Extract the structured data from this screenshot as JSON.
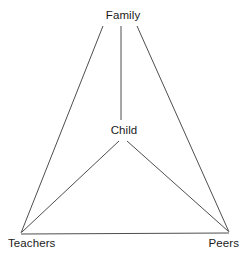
{
  "diagram": {
    "background_color": "#ffffff",
    "line_color": "#3a3a3a",
    "text_color": "#1a1a1a",
    "nodes": [
      {
        "id": "family",
        "label": "Family",
        "x": 121,
        "y": 16
      },
      {
        "id": "child",
        "label": "Child",
        "x": 122,
        "y": 131
      },
      {
        "id": "teachers",
        "label": "Teachers",
        "x": 21,
        "y": 234
      },
      {
        "id": "peers",
        "label": "Peers",
        "x": 229,
        "y": 233
      }
    ],
    "edges": [
      {
        "id": "family-teachers",
        "from": "family",
        "to": "teachers",
        "x1": 103,
        "y1": 26,
        "x2": 21,
        "y2": 233
      },
      {
        "id": "family-peers",
        "from": "family",
        "to": "peers",
        "x1": 137,
        "y1": 26,
        "x2": 229,
        "y2": 232
      },
      {
        "id": "family-child",
        "from": "family",
        "to": "child",
        "x1": 121,
        "y1": 26,
        "x2": 121,
        "y2": 120
      },
      {
        "id": "child-teachers",
        "from": "child",
        "to": "teachers",
        "x1": 119,
        "y1": 141,
        "x2": 22,
        "y2": 232
      },
      {
        "id": "child-peers",
        "from": "child",
        "to": "peers",
        "x1": 127,
        "y1": 141,
        "x2": 228,
        "y2": 231
      },
      {
        "id": "teachers-peers",
        "from": "teachers",
        "to": "peers",
        "x1": 21,
        "y1": 234,
        "x2": 229,
        "y2": 233
      }
    ]
  }
}
